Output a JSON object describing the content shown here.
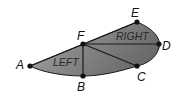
{
  "diagram": {
    "colors": {
      "fill_light": "#b0b0b0",
      "fill_dark": "#6e6e6e",
      "stroke": "#1a1a1a",
      "point": "#111111",
      "background": "#ffffff"
    },
    "points": {
      "A": {
        "label": "A",
        "x": 30,
        "y": 66
      },
      "B": {
        "label": "B",
        "x": 83,
        "y": 76
      },
      "C": {
        "label": "C",
        "x": 137,
        "y": 66
      },
      "D": {
        "label": "D",
        "x": 159,
        "y": 44
      },
      "E": {
        "label": "E",
        "x": 137,
        "y": 22
      },
      "F": {
        "label": "F",
        "x": 83,
        "y": 44
      }
    },
    "regions": {
      "left": "LEFT",
      "right": "RIGHT"
    },
    "segments": [
      "AE",
      "FB",
      "FC",
      "FD"
    ]
  }
}
